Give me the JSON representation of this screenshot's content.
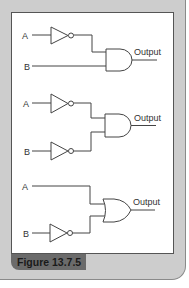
{
  "figure": {
    "caption": "Figure 13.7.5",
    "colors": {
      "panel": "#cdcdcd",
      "caption_bg": "#6b6b6b",
      "line": "#444444"
    }
  },
  "circuits": [
    {
      "inputs": [
        {
          "label": "A",
          "inverted": true
        },
        {
          "label": "B",
          "inverted": false
        }
      ],
      "gate": "AND",
      "output_label": "Output"
    },
    {
      "inputs": [
        {
          "label": "A",
          "inverted": true
        },
        {
          "label": "B",
          "inverted": true
        }
      ],
      "gate": "AND",
      "output_label": "Output"
    },
    {
      "inputs": [
        {
          "label": "A",
          "inverted": false
        },
        {
          "label": "B",
          "inverted": true
        }
      ],
      "gate": "OR",
      "output_label": "Output"
    }
  ]
}
